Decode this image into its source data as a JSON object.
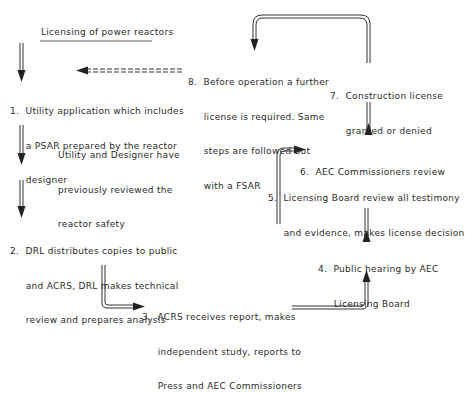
{
  "title": "Licensing of power reactors",
  "steps": [
    {
      "id": 1,
      "lines": [
        "1.  Utility application which includes",
        "     a PSAR prepared by the reactor",
        "     designer"
      ]
    },
    {
      "id": "note",
      "lines": [
        "Utility and Designer have",
        "previously reviewed the",
        "reactor safety"
      ]
    },
    {
      "id": 2,
      "lines": [
        "2.  DRL distributes copies to public",
        "     and ACRS, DRL makes technical",
        "     review and prepares analysis"
      ]
    },
    {
      "id": 3,
      "lines": [
        "3.  ACRS receives report, makes",
        "     independent study, reports to",
        "     Press and AEC Commissioners"
      ]
    },
    {
      "id": 4,
      "lines": [
        "4.  Public hearing by AEC",
        "     Licensing Board"
      ]
    },
    {
      "id": 5,
      "lines": [
        "5.  Licensing Board review all testimony",
        "     and evidence, makes license decision"
      ]
    },
    {
      "id": 6,
      "lines": [
        "6.  AEC Commissioners review"
      ]
    },
    {
      "id": 7,
      "lines": [
        "7.  Construction license",
        "     granted or denied"
      ]
    },
    {
      "id": 8,
      "lines": [
        "8.  Before operation a further",
        "     license is required. Same",
        "     steps are followed but",
        "     with a FSAR"
      ]
    }
  ],
  "connectors": [
    {
      "from": "title",
      "to": 1,
      "style": "double-line-arrow-down"
    },
    {
      "from": 1,
      "to": 2,
      "style": "double-line-arrow-down"
    },
    {
      "from": 2,
      "to": 3,
      "style": "double-line-elbow-right"
    },
    {
      "from": 3,
      "to": 4,
      "style": "double-line-elbow-up"
    },
    {
      "from": 4,
      "to": 5,
      "style": "double-line-arrow-up"
    },
    {
      "from": 5,
      "to": 6,
      "style": "double-line-elbow-right"
    },
    {
      "from": 6,
      "to": 7,
      "style": "double-line-arrow-up"
    },
    {
      "from": 7,
      "to": 8,
      "style": "double-line-loop-over"
    },
    {
      "from": 8,
      "to": 1,
      "style": "dashed-arrow-left"
    }
  ]
}
